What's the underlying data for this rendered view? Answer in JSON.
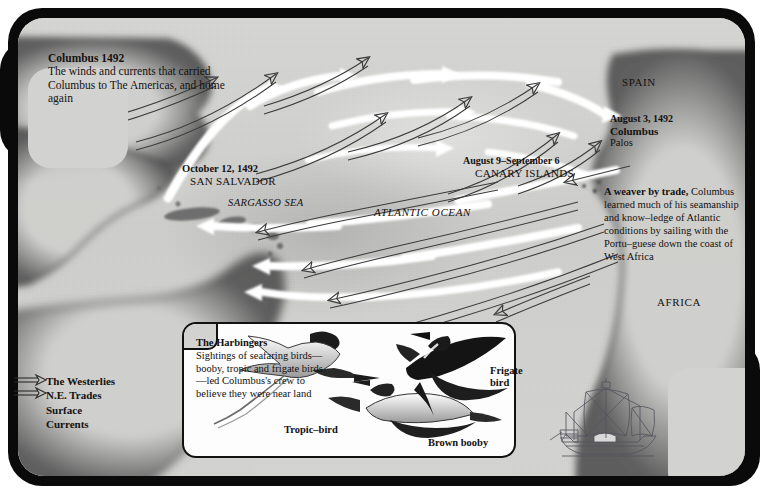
{
  "map": {
    "title_block": {
      "heading": "Columbus 1492",
      "body": "The winds and currents that carried Columbus to The Americas, and home again"
    },
    "landfall": {
      "date": "October 12, 1492",
      "place": "SAN SALVADOR"
    },
    "sargasso_label": "SARGASSO SEA",
    "ocean_label": "ATLANTIC OCEAN",
    "canary": {
      "date": "August 9–September 6",
      "place": "CANARY ISLANDS"
    },
    "spain_label": "SPAIN",
    "departure": {
      "date": "August 3, 1492",
      "name": "Columbus",
      "port": "Palos"
    },
    "weaver_block": {
      "heading": "A weaver by trade,",
      "body": "Columbus learned much of his seamanship and know–ledge of Atlantic conditions by sailing with the Portu–guese down the coast of West Africa"
    },
    "africa_label": "AFRICA",
    "legend": {
      "items": [
        {
          "label": "The Westerlies",
          "icon": "arrow-right-outline-icon",
          "has_arrow": true
        },
        {
          "label": "N.E. Trades",
          "icon": "arrow-right-outline-icon",
          "has_arrow": true
        },
        {
          "label": "Surface",
          "icon": "",
          "has_arrow": false
        },
        {
          "label": "Currents",
          "icon": "",
          "has_arrow": false
        }
      ]
    }
  },
  "inset": {
    "heading": "The Harbingers",
    "body": "Sightings of seafaring birds—booby, tropic and frigate birds—led Columbus's crew to believe they were near land",
    "bird_labels": {
      "tropic": "Tropic–bird",
      "booby": "Brown booby",
      "frigate_line1": "Frigate",
      "frigate_line2": "bird"
    }
  },
  "colors": {
    "frame": "#0a0a0a",
    "paper": "#d2d2d0",
    "ink": "#14110f",
    "wind_arrow": "#ffffff",
    "current_arrow": "#3b3b3b",
    "inset_bg": "#fdfdfd"
  }
}
